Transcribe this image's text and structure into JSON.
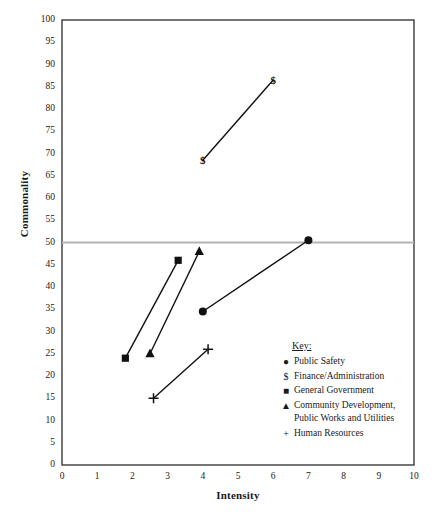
{
  "chart_data": {
    "type": "scatter",
    "title": "",
    "xlabel": "Intensity",
    "ylabel": "Commonality",
    "xlim": [
      0,
      10
    ],
    "ylim": [
      0,
      100
    ],
    "xticks": [
      0,
      1,
      2,
      3,
      4,
      5,
      6,
      7,
      8,
      9,
      10
    ],
    "yticks": [
      0,
      5,
      10,
      15,
      20,
      25,
      30,
      35,
      40,
      45,
      50,
      55,
      60,
      65,
      70,
      75,
      80,
      85,
      90,
      95,
      100
    ],
    "grid": false,
    "legend_position": "inside-lower-right",
    "reference_lines": [
      {
        "axis": "y",
        "value": 50,
        "color": "#b3b3b3"
      }
    ],
    "series": [
      {
        "name": "Public Safety",
        "marker": "circle",
        "points": [
          {
            "x": 4.0,
            "y": 34.5
          },
          {
            "x": 7.0,
            "y": 50.5
          }
        ]
      },
      {
        "name": "Finance/Administration",
        "marker": "dollar",
        "points": [
          {
            "x": 4.0,
            "y": 68.5
          },
          {
            "x": 6.0,
            "y": 86.5
          }
        ]
      },
      {
        "name": "General Government",
        "marker": "square",
        "points": [
          {
            "x": 1.8,
            "y": 24.0
          },
          {
            "x": 3.3,
            "y": 46.0
          }
        ]
      },
      {
        "name": "Community Development, Public Works and Utilities",
        "marker": "triangle",
        "points": [
          {
            "x": 2.5,
            "y": 25.0
          },
          {
            "x": 3.9,
            "y": 48.0
          }
        ]
      },
      {
        "name": "Human Resources",
        "marker": "plus",
        "points": [
          {
            "x": 2.6,
            "y": 15.0
          },
          {
            "x": 4.15,
            "y": 26.0
          }
        ]
      }
    ]
  },
  "legend": {
    "title": "Key:",
    "entries": [
      {
        "marker": "●",
        "label": "Public Safety"
      },
      {
        "marker": "$",
        "label": "Finance/Administration"
      },
      {
        "marker": "■",
        "label": "General Government"
      },
      {
        "marker": "▲",
        "label": "Community Development,",
        "label2": "Public Works and Utilities"
      },
      {
        "marker": "+",
        "label": "Human Resources"
      }
    ]
  },
  "colors": {
    "axis": "#2b2b2b",
    "series": "#111111",
    "reference_line": "#b3b3b3",
    "background": "#ffffff"
  }
}
